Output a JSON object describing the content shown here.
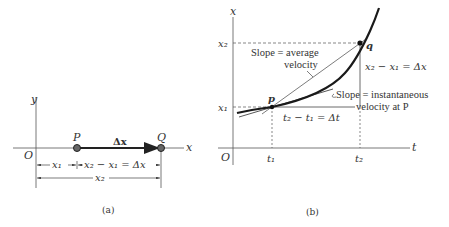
{
  "panel_a": {
    "caption": "(a)",
    "axis_x_label": "x",
    "axis_y_label": "y",
    "origin_label": "O",
    "point_p_label": "P",
    "point_q_label": "Q",
    "vector_label": "Δx",
    "dim_x1_label": "x₁",
    "dim_diff_label": "x₂ − x₁ = Δx",
    "dim_x2_label": "x₂"
  },
  "panel_b": {
    "caption": "(b)",
    "axis_vertical_label": "x",
    "axis_horizontal_label": "t",
    "origin_label": "O",
    "tick_x1": "x₁",
    "tick_x2": "x₂",
    "tick_t1": "t₁",
    "tick_t2": "t₂",
    "point_p_label": "p",
    "point_q_label": "q",
    "avg_slope_line1": "Slope =  average",
    "avg_slope_line2": "velocity",
    "inst_slope_line1": "Slope =  instantaneous",
    "inst_slope_line2": "velocity at P",
    "delta_x_label": "x₂ − x₁ = Δx",
    "delta_t_label": "t₂ − t₁ = Δt"
  },
  "colors": {
    "ink": "#333333",
    "curve": "#1a1a1a",
    "background": "#ffffff"
  }
}
